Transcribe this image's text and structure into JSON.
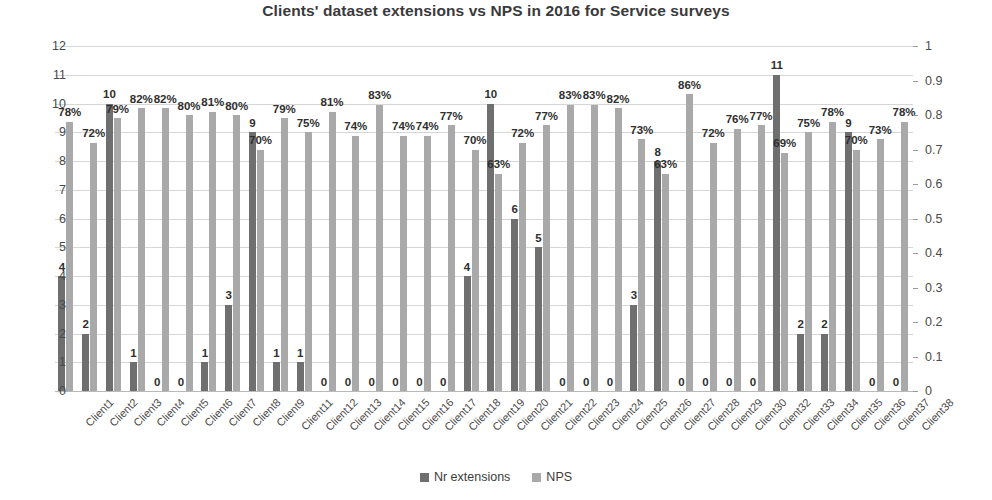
{
  "chart_data": {
    "type": "bar",
    "title": "Clients' dataset extensions vs NPS in 2016 for Service surveys",
    "xlabel": "",
    "ylabel": "",
    "grid": true,
    "legend_position": "bottom",
    "ylim": [
      0,
      12
    ],
    "y2lim": [
      0,
      1
    ],
    "yticks": [
      "0",
      "1",
      "2",
      "3",
      "4",
      "5",
      "6",
      "7",
      "8",
      "9",
      "10",
      "11",
      "12"
    ],
    "y2ticks": [
      "0",
      "0.1",
      "0.2",
      "0.3",
      "0.4",
      "0.5",
      "0.6",
      "0.7",
      "0.8",
      "0.9",
      "1"
    ],
    "categories": [
      "Client1",
      "Client2",
      "Client3",
      "Client4",
      "Client5",
      "Client6",
      "Client7",
      "Client8",
      "Client9",
      "Client11",
      "Client12",
      "Client13",
      "Client14",
      "Client15",
      "Client16",
      "Client17",
      "Client18",
      "Client19",
      "Client20",
      "Client21",
      "Client22",
      "Client23",
      "Client24",
      "Client25",
      "Client26",
      "Client27",
      "Client28",
      "Client29",
      "Client30",
      "Client32",
      "Client33",
      "Client34",
      "Client35",
      "Client36",
      "Client37",
      "Client38"
    ],
    "series": [
      {
        "name": "Nr extensions",
        "axis": "left",
        "color": "#6f6f6f",
        "values": [
          4,
          2,
          10,
          1,
          0,
          0,
          1,
          3,
          9,
          1,
          1,
          0,
          0,
          0,
          0,
          0,
          0,
          4,
          10,
          6,
          5,
          0,
          0,
          0,
          3,
          8,
          0,
          0,
          0,
          0,
          11,
          2,
          2,
          9,
          0,
          0
        ],
        "labels": [
          "4",
          "2",
          "10",
          "1",
          "0",
          "0",
          "1",
          "3",
          "9",
          "1",
          "1",
          "0",
          "0",
          "0",
          "0",
          "0",
          "0",
          "4",
          "10",
          "6",
          "5",
          "0",
          "0",
          "0",
          "3",
          "8",
          "0",
          "0",
          "0",
          "0",
          "11",
          "2",
          "2",
          "9",
          "0",
          "0"
        ]
      },
      {
        "name": "NPS",
        "axis": "right",
        "color": "#a9a9a9",
        "values": [
          0.78,
          0.72,
          0.79,
          0.82,
          0.82,
          0.8,
          0.81,
          0.8,
          0.7,
          0.79,
          0.75,
          0.81,
          0.74,
          0.83,
          0.74,
          0.74,
          0.77,
          0.7,
          0.63,
          0.72,
          0.77,
          0.83,
          0.83,
          0.82,
          0.73,
          0.63,
          0.86,
          0.72,
          0.76,
          0.77,
          0.69,
          0.75,
          0.78,
          0.7,
          0.73,
          0.78
        ],
        "labels": [
          "78%",
          "72%",
          "79%",
          "82%",
          "82%",
          "80%",
          "81%",
          "80%",
          "70%",
          "79%",
          "75%",
          "81%",
          "74%",
          "83%",
          "74%",
          "74%",
          "77%",
          "70%",
          "63%",
          "72%",
          "77%",
          "83%",
          "83%",
          "82%",
          "73%",
          "63%",
          "86%",
          "72%",
          "76%",
          "77%",
          "69%",
          "75%",
          "78%",
          "70%",
          "73%",
          "78%"
        ]
      }
    ]
  },
  "legend": {
    "items": [
      {
        "label": "Nr extensions",
        "color": "#6f6f6f"
      },
      {
        "label": "NPS",
        "color": "#a9a9a9"
      }
    ]
  }
}
